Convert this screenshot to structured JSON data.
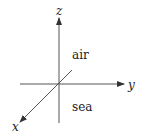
{
  "diagram": {
    "axes": [
      {
        "name": "z",
        "label": "z",
        "direction": "up"
      },
      {
        "name": "y",
        "label": "y",
        "direction": "right"
      },
      {
        "name": "x",
        "label": "x",
        "direction": "down-left"
      }
    ],
    "regions": [
      {
        "name": "air",
        "label": "air",
        "position": "above horizontal plane"
      },
      {
        "name": "sea",
        "label": "sea",
        "position": "below horizontal plane"
      }
    ],
    "colors": {
      "line": "#555555",
      "text": "#222222",
      "background": "#ffffff"
    }
  }
}
